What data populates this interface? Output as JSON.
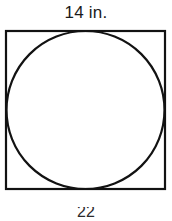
{
  "figure": {
    "type": "square-with-inscribed-circle",
    "top_label": "14 in.",
    "bottom_caption": "22",
    "background_color": "#ffffff",
    "stroke_color": "#121212",
    "text_color": "#1a1a1a",
    "square": {
      "side_label": "14 in.",
      "side_units": "in.",
      "side_length": 14,
      "x": 6,
      "y": 31,
      "width": 159,
      "height": 158,
      "stroke_width": 2
    },
    "circle": {
      "cx": 85.5,
      "cy": 110,
      "r": 79,
      "diameter_label": "14 in.",
      "stroke_width": 2,
      "fill": "none"
    }
  }
}
